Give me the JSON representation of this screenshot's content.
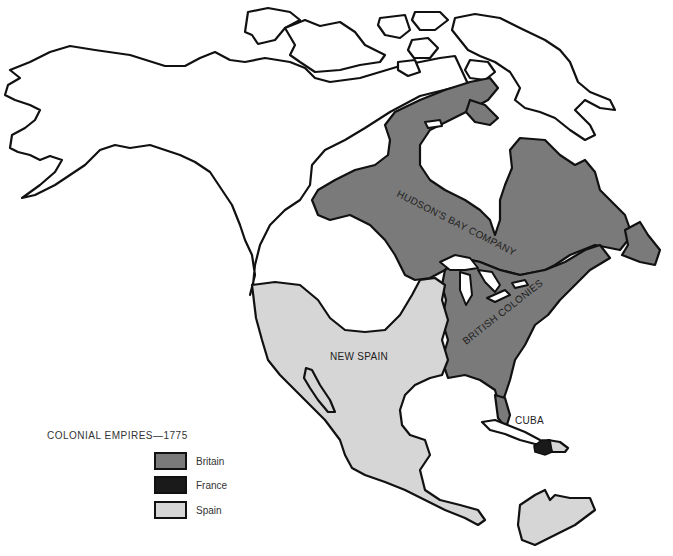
{
  "map": {
    "title": "COLONIAL EMPIRES—1775",
    "region_labels": {
      "hudsons_bay": "HUDSON'S BAY COMPANY",
      "british_colonies": "BRITISH COLONIES",
      "new_spain": "NEW SPAIN",
      "cuba": "CUBA"
    },
    "colors": {
      "britain": "#7a7a7a",
      "france": "#1a1a1a",
      "spain": "#d6d6d6",
      "land_unclaimed": "#ffffff",
      "outline": "#111111"
    }
  },
  "legend": {
    "title": "COLONIAL EMPIRES—1775",
    "items": [
      {
        "label": "Britain",
        "color": "#7a7a7a"
      },
      {
        "label": "France",
        "color": "#1a1a1a"
      },
      {
        "label": "Spain",
        "color": "#d6d6d6"
      }
    ]
  }
}
